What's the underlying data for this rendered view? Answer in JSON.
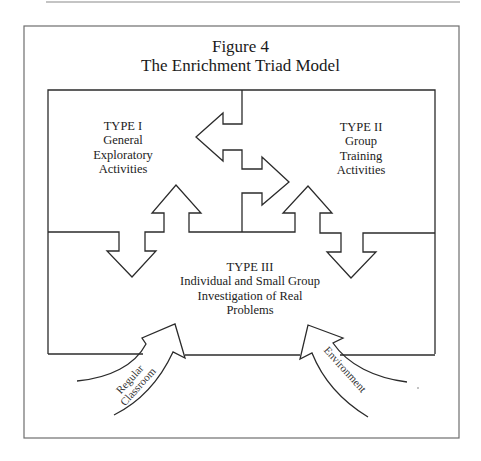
{
  "figure": {
    "number_label": "Figure 4",
    "title": "The Enrichment Triad Model"
  },
  "regions": {
    "type_i": {
      "heading": "TYPE I",
      "lines": [
        "General",
        "Exploratory",
        "Activities"
      ]
    },
    "type_ii": {
      "heading": "TYPE II",
      "lines": [
        "Group",
        "Training",
        "Activities"
      ]
    },
    "type_iii": {
      "heading": "TYPE III",
      "lines": [
        "Individual and Small Group",
        "Investigation of Real",
        "Problems"
      ]
    }
  },
  "inputs": {
    "left_arrow": {
      "lines": [
        "Regular",
        "Classroom"
      ]
    },
    "right_arrow": {
      "label": "Environment"
    }
  },
  "colors": {
    "stroke": "#2b2b2b",
    "frame": "#6e6e6e",
    "background": "#ffffff"
  }
}
